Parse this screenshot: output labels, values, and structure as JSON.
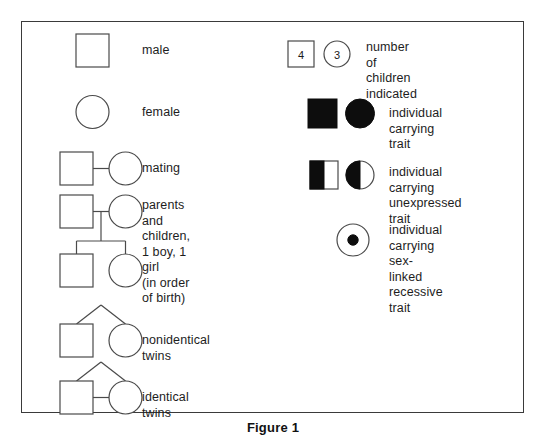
{
  "figure": {
    "caption": "Figure 1",
    "border_color": "#3a3a3a",
    "background": "#ffffff",
    "symbol_stroke": "#4a4a4a",
    "fill_color": "#0d0d0d"
  },
  "legend": {
    "left_column": [
      {
        "key": "male",
        "label": "male",
        "symbols": "square-outline"
      },
      {
        "key": "female",
        "label": "female",
        "symbols": "circle-outline"
      },
      {
        "key": "mating",
        "label": "mating",
        "symbols": "square-line-circle"
      },
      {
        "key": "parents",
        "label": "parents and\nchildren,\n1 boy, 1 girl\n(in order of birth)",
        "symbols": "pedigree-two-children"
      },
      {
        "key": "nonidentical",
        "label": "nonidentical twins",
        "symbols": "twins-fraternal"
      },
      {
        "key": "identical",
        "label": "identical twins",
        "symbols": "twins-identical"
      }
    ],
    "right_column": [
      {
        "key": "children_count",
        "label": "number of children\nindicated",
        "symbols": "numbered-square-circle",
        "square_value": "4",
        "circle_value": "3"
      },
      {
        "key": "carrying_trait",
        "label": "individual carrying trait",
        "symbols": "filled-square-circle"
      },
      {
        "key": "unexpressed_trait",
        "label": "individual carrying\nunexpressed trait",
        "symbols": "half-filled-square-circle"
      },
      {
        "key": "sex_linked",
        "label": "individual carrying\nsex-linked\nrecessive trait",
        "symbols": "circle-with-dot"
      }
    ]
  }
}
